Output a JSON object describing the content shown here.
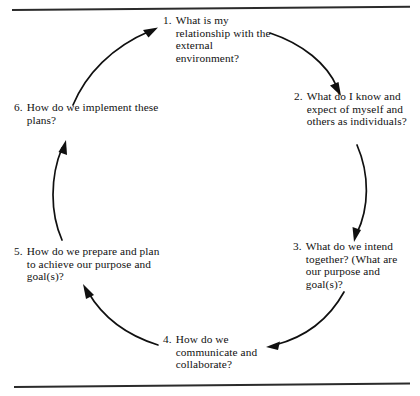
{
  "diagram": {
    "type": "cycle",
    "direction": "clockwise",
    "step_count": 6,
    "background_color": "#ffffff",
    "ink_color": "#101010",
    "rules": {
      "top": "horizontal-rule",
      "bottom": "horizontal-rule"
    },
    "steps": [
      {
        "number": "1.",
        "text": "What is my relationship with the external environment?",
        "position": "top"
      },
      {
        "number": "2.",
        "text": "What do I know and expect of myself and others as individuals?",
        "position": "upper-right"
      },
      {
        "number": "3.",
        "text": "What do we intend together? (What are our purpose and goal(s)?",
        "position": "lower-right"
      },
      {
        "number": "4.",
        "text": "How do we communicate and collaborate?",
        "position": "bottom"
      },
      {
        "number": "5.",
        "text": "How do we prepare and plan to achieve our purpose and goal(s)?",
        "position": "lower-left"
      },
      {
        "number": "6.",
        "text": "How do we implement these plans?",
        "position": "upper-left"
      }
    ],
    "arrows": [
      {
        "from": "6",
        "to": "1",
        "name": "arrow-6-to-1"
      },
      {
        "from": "1",
        "to": "2",
        "name": "arrow-1-to-2"
      },
      {
        "from": "2",
        "to": "3",
        "name": "arrow-2-to-3"
      },
      {
        "from": "3",
        "to": "4",
        "name": "arrow-3-to-4"
      },
      {
        "from": "4",
        "to": "5",
        "name": "arrow-4-to-5"
      },
      {
        "from": "5",
        "to": "6",
        "name": "arrow-5-to-6"
      }
    ]
  }
}
